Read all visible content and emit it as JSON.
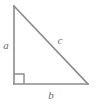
{
  "figure": {
    "name": "right-triangle",
    "background_color": "#ffffff",
    "stroke_color": "#8c8c8c",
    "label_color": "#6d6d6d",
    "stroke_width": 1.6
  },
  "vertices": {
    "apex": {
      "x": 14,
      "y": 6
    },
    "right_angle": {
      "x": 14,
      "y": 84
    },
    "base_right": {
      "x": 88,
      "y": 84
    }
  },
  "right_angle_marker": {
    "name": "right-angle-marker",
    "size": 10,
    "visible": true
  },
  "labels": {
    "leg_vertical": {
      "text": "a",
      "x": 6,
      "y": 49
    },
    "hypotenuse": {
      "text": "c",
      "x": 60,
      "y": 44
    },
    "leg_horizontal": {
      "text": "b",
      "x": 51,
      "y": 99
    }
  }
}
